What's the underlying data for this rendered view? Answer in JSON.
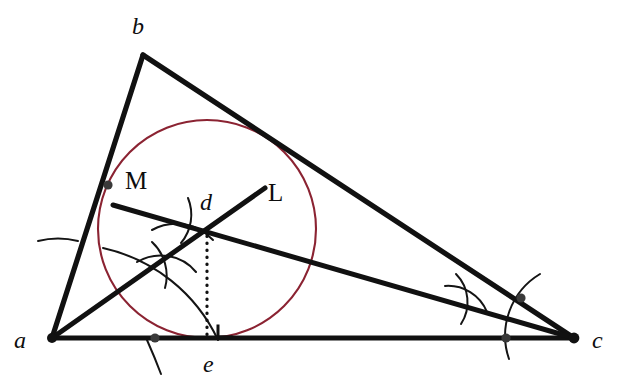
{
  "figure": {
    "canvas": {
      "width": 636,
      "height": 386
    },
    "colors": {
      "stroke": "#111111",
      "circle": "#8B2332",
      "background": "#ffffff",
      "point_fill": "#3a3a3a"
    }
  },
  "labels": {
    "vertex_a": "a",
    "vertex_b": "b",
    "vertex_c": "c",
    "incenter_d": "d",
    "foot_e": "e",
    "bisector_M": "M",
    "bisector_L": "L"
  },
  "geometry": {
    "triangle": {
      "name": "triangle-abc",
      "vertices": {
        "a": {
          "x": 52,
          "y": 338
        },
        "b": {
          "x": 143,
          "y": 55
        },
        "c": {
          "x": 574,
          "y": 338
        }
      },
      "sides": [
        "ab",
        "bc",
        "ca"
      ]
    },
    "incircle": {
      "name": "incircle",
      "center": {
        "x": 207,
        "y": 229
      },
      "radius": 109,
      "tangent_point_on_ac": {
        "x": 207,
        "y": 338
      }
    },
    "incenter": {
      "x": 207,
      "y": 229
    },
    "perpendicular_foot": {
      "x": 207,
      "y": 338
    },
    "bisector_from_a": {
      "name": "angle-bisector-a",
      "label": "L",
      "from": {
        "x": 52,
        "y": 338
      },
      "through": {
        "x": 207,
        "y": 229
      },
      "to": {
        "x": 265,
        "y": 188
      }
    },
    "bisector_from_c": {
      "name": "angle-bisector-c",
      "label": "M",
      "from": {
        "x": 574,
        "y": 338
      },
      "through": {
        "x": 207,
        "y": 229
      },
      "to": {
        "x": 113,
        "y": 205
      }
    },
    "perpendicular_segment": {
      "name": "perpendicular-d-to-e",
      "from": {
        "x": 207,
        "y": 229
      },
      "to": {
        "x": 207,
        "y": 338
      },
      "style": "dotted"
    },
    "right_angle_marker": {
      "name": "right-angle-marker",
      "at": {
        "x": 207,
        "y": 338
      },
      "size": 12
    },
    "construction_points": [
      {
        "name": "point-on-ab-from-a",
        "x": 108,
        "y": 185
      },
      {
        "name": "point-on-ac-from-a",
        "x": 155,
        "y": 338
      },
      {
        "name": "point-on-bc-from-c",
        "x": 521,
        "y": 298
      },
      {
        "name": "point-on-ac-from-c",
        "x": 506,
        "y": 338
      }
    ]
  },
  "construction_steps": {
    "step_1": "Draw arcs centered at a crossing sides ab and ac.",
    "step_2": "Draw arcs centered at c crossing sides cb and ca.",
    "step_3": "Cross arcs to locate bisector directions L and M.",
    "step_4": "Bisectors L and M intersect at incenter d.",
    "step_5": "Drop perpendicular from d to ac meeting at e.",
    "step_6": "Draw the incircle centered at d with radius de."
  }
}
